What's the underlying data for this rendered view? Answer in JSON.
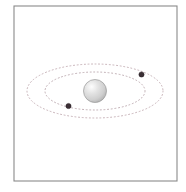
{
  "figure": {
    "background_color": "#ffffff",
    "width": 186,
    "height": 192
  },
  "frame": {
    "name": "plot-border",
    "x": 14,
    "y": 6,
    "width": 163,
    "height": 175,
    "stroke_color": "#8a8a8a",
    "stroke_width": 1.1,
    "fill": "none"
  },
  "star": {
    "label": "central-star",
    "cx": 95,
    "cy": 91,
    "r": 11.5,
    "fill_center": "#fcfcfc",
    "fill_mid": "#d8d8d8",
    "fill_edge": "#b4b4b4",
    "stroke_color": "#9a9a9a",
    "stroke_width": 0.7,
    "highlight_offset_x": -3.5,
    "highlight_offset_y": -3.5
  },
  "orbits": [
    {
      "label": "inner-orbit",
      "cx": 95,
      "cy": 91,
      "rx": 50,
      "ry": 19,
      "stroke_color": "#c0aeb4",
      "stroke_width": 1.0,
      "dash": "1,2.6"
    },
    {
      "label": "outer-orbit",
      "cx": 95,
      "cy": 91,
      "rx": 68,
      "ry": 27,
      "stroke_color": "#c7b2b8",
      "stroke_width": 1.0,
      "dash": "1,2.6"
    }
  ],
  "bodies": [
    {
      "label": "planet-outer-right",
      "cx": 141.5,
      "cy": 74.5,
      "r": 2.6,
      "fill": "#3b2f35",
      "stroke_color": "#241c20",
      "stroke_width": 0.5
    },
    {
      "label": "planet-inner-left",
      "cx": 68.5,
      "cy": 106.0,
      "r": 2.6,
      "fill": "#3b2f35",
      "stroke_color": "#241c20",
      "stroke_width": 0.5
    }
  ],
  "chart_data": {
    "type": "scatter",
    "title": "",
    "xlabel": "",
    "ylabel": "",
    "grid": false,
    "legend": "none",
    "series": [
      {
        "name": "inner-orbit-path",
        "kind": "ellipse",
        "center": [
          95,
          91
        ],
        "semi_major": 50,
        "semi_minor": 19,
        "style": "dotted"
      },
      {
        "name": "outer-orbit-path",
        "kind": "ellipse",
        "center": [
          95,
          91
        ],
        "semi_major": 68,
        "semi_minor": 27,
        "style": "dotted"
      },
      {
        "name": "bodies",
        "kind": "points",
        "x": [
          141.5,
          68.5
        ],
        "y": [
          74.5,
          106.0
        ]
      },
      {
        "name": "central-star",
        "kind": "points",
        "x": [
          95
        ],
        "y": [
          91
        ]
      }
    ]
  }
}
